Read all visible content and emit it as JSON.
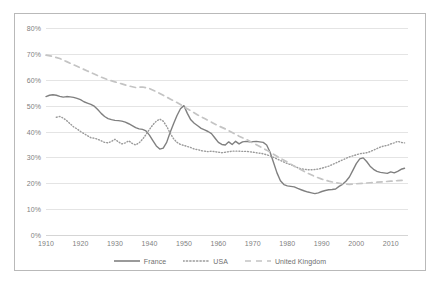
{
  "chart_data": {
    "type": "line",
    "title": "",
    "subtitle": "",
    "xlabel": "",
    "ylabel": "",
    "xlim": [
      1910,
      2015
    ],
    "ylim": [
      0,
      0.8
    ],
    "grid": true,
    "legend_position": "bottom",
    "y_ticks": [
      "0%",
      "10%",
      "20%",
      "30%",
      "40%",
      "50%",
      "60%",
      "70%",
      "80%"
    ],
    "y_tick_values": [
      0,
      10,
      20,
      30,
      40,
      50,
      60,
      70,
      80
    ],
    "x_ticks": [
      "1910",
      "1920",
      "1930",
      "1940",
      "1950",
      "1960",
      "1970",
      "1980",
      "1990",
      "2000",
      "2010"
    ],
    "x_tick_values": [
      1910,
      1920,
      1930,
      1940,
      1950,
      1960,
      1970,
      1980,
      1990,
      2000,
      2010
    ],
    "series": [
      {
        "name": "France",
        "style": "solid",
        "color": "#808080",
        "x": [
          1910,
          1911,
          1912,
          1913,
          1914,
          1915,
          1916,
          1917,
          1918,
          1919,
          1920,
          1921,
          1922,
          1923,
          1924,
          1925,
          1926,
          1927,
          1928,
          1929,
          1930,
          1931,
          1932,
          1933,
          1934,
          1935,
          1936,
          1937,
          1938,
          1939,
          1940,
          1941,
          1942,
          1943,
          1944,
          1945,
          1946,
          1947,
          1948,
          1949,
          1950,
          1951,
          1952,
          1953,
          1954,
          1955,
          1956,
          1957,
          1958,
          1959,
          1960,
          1961,
          1962,
          1963,
          1964,
          1965,
          1966,
          1967,
          1968,
          1969,
          1970,
          1971,
          1972,
          1973,
          1974,
          1975,
          1976,
          1977,
          1978,
          1979,
          1980,
          1981,
          1982,
          1983,
          1984,
          1985,
          1986,
          1987,
          1988,
          1989,
          1990,
          1991,
          1992,
          1993,
          1994,
          1995,
          1996,
          1997,
          1998,
          1999,
          2000,
          2001,
          2002,
          2003,
          2004,
          2005,
          2006,
          2007,
          2008,
          2009,
          2010,
          2011,
          2012,
          2013,
          2014
        ],
        "values": [
          53.5,
          54.0,
          54.2,
          54.0,
          53.6,
          53.3,
          53.5,
          53.4,
          53.2,
          52.8,
          52.3,
          51.5,
          51.0,
          50.5,
          49.8,
          48.5,
          47.0,
          45.8,
          45.0,
          44.6,
          44.3,
          44.2,
          44.0,
          43.6,
          43.0,
          42.3,
          41.5,
          41.0,
          40.8,
          40.2,
          38.6,
          36.5,
          34.4,
          33.2,
          33.6,
          35.8,
          39.6,
          43.0,
          46.2,
          48.8,
          50.0,
          47.0,
          44.5,
          43.2,
          42.2,
          41.2,
          40.6,
          40.0,
          39.2,
          37.5,
          35.8,
          35.0,
          34.8,
          36.0,
          35.0,
          36.2,
          35.2,
          36.0,
          36.2,
          36.0,
          36.1,
          36.2,
          36.0,
          35.8,
          34.8,
          32.0,
          28.0,
          24.0,
          21.0,
          19.5,
          19.0,
          18.8,
          18.6,
          18.0,
          17.5,
          17.0,
          16.6,
          16.3,
          16.0,
          16.3,
          16.8,
          17.2,
          17.5,
          17.6,
          17.8,
          18.8,
          19.6,
          20.8,
          22.4,
          25.0,
          27.6,
          29.4,
          29.8,
          28.4,
          26.6,
          25.4,
          24.6,
          24.2,
          24.0,
          23.8,
          24.4,
          24.0,
          24.6,
          25.4,
          25.8
        ]
      },
      {
        "name": "USA",
        "style": "dotted",
        "color": "#9a9a9a",
        "x": [
          1913,
          1914,
          1915,
          1916,
          1917,
          1918,
          1919,
          1920,
          1921,
          1922,
          1923,
          1924,
          1925,
          1926,
          1927,
          1928,
          1929,
          1930,
          1931,
          1932,
          1933,
          1934,
          1935,
          1936,
          1937,
          1938,
          1939,
          1940,
          1941,
          1942,
          1943,
          1944,
          1945,
          1946,
          1947,
          1948,
          1949,
          1950,
          1951,
          1952,
          1953,
          1954,
          1955,
          1956,
          1957,
          1958,
          1959,
          1960,
          1961,
          1962,
          1963,
          1964,
          1965,
          1966,
          1967,
          1968,
          1969,
          1970,
          1971,
          1972,
          1973,
          1974,
          1975,
          1976,
          1977,
          1978,
          1979,
          1980,
          1981,
          1982,
          1983,
          1984,
          1985,
          1986,
          1987,
          1988,
          1989,
          1990,
          1991,
          1992,
          1993,
          1994,
          1995,
          1996,
          1997,
          1998,
          1999,
          2000,
          2001,
          2002,
          2003,
          2004,
          2005,
          2006,
          2007,
          2008,
          2009,
          2010,
          2011,
          2012,
          2013,
          2014
        ],
        "values": [
          45.5,
          45.8,
          45.2,
          44.2,
          43.0,
          41.8,
          41.0,
          40.0,
          39.2,
          38.4,
          37.6,
          37.4,
          37.0,
          36.4,
          35.8,
          35.6,
          36.2,
          37.0,
          36.0,
          35.2,
          35.6,
          36.4,
          35.4,
          34.8,
          35.6,
          37.0,
          38.8,
          40.8,
          42.6,
          44.0,
          44.8,
          44.0,
          42.0,
          39.4,
          37.2,
          35.8,
          35.0,
          34.6,
          34.2,
          33.8,
          33.2,
          33.0,
          32.6,
          32.4,
          32.2,
          32.4,
          32.2,
          32.0,
          31.8,
          32.0,
          32.2,
          32.4,
          32.4,
          32.4,
          32.3,
          32.3,
          32.2,
          32.0,
          31.8,
          31.6,
          31.4,
          31.0,
          30.6,
          30.0,
          29.4,
          28.8,
          28.2,
          27.6,
          27.2,
          26.6,
          26.0,
          25.6,
          25.4,
          25.2,
          25.2,
          25.3,
          25.5,
          25.8,
          26.2,
          26.6,
          27.2,
          27.8,
          28.4,
          29.0,
          29.6,
          30.2,
          30.6,
          31.0,
          31.4,
          31.6,
          31.8,
          32.2,
          32.8,
          33.4,
          34.0,
          34.4,
          34.6,
          35.2,
          35.6,
          36.2,
          35.8,
          35.6
        ]
      },
      {
        "name": "United Kingdom",
        "style": "dashed",
        "color": "#c4c4c4",
        "x": [
          1910,
          1912,
          1914,
          1916,
          1918,
          1920,
          1922,
          1924,
          1926,
          1928,
          1930,
          1932,
          1934,
          1936,
          1938,
          1940,
          1942,
          1944,
          1946,
          1948,
          1950,
          1952,
          1954,
          1956,
          1958,
          1960,
          1962,
          1964,
          1966,
          1968,
          1970,
          1972,
          1974,
          1976,
          1978,
          1980,
          1982,
          1984,
          1986,
          1988,
          1990,
          1992,
          1994,
          1996,
          1998,
          2000,
          2002,
          2004,
          2006,
          2008,
          2010,
          2012,
          2014
        ],
        "values": [
          69.5,
          69.0,
          68.2,
          67.0,
          65.8,
          64.6,
          63.4,
          62.2,
          61.0,
          60.0,
          59.2,
          58.4,
          57.6,
          57.0,
          57.2,
          56.6,
          55.4,
          54.0,
          52.6,
          51.2,
          49.6,
          48.0,
          46.4,
          45.0,
          43.6,
          42.2,
          41.0,
          39.6,
          38.2,
          37.0,
          35.6,
          34.2,
          32.8,
          31.2,
          29.6,
          28.2,
          26.6,
          25.2,
          23.8,
          22.6,
          21.6,
          20.8,
          20.2,
          19.8,
          19.6,
          19.8,
          20.0,
          20.2,
          20.4,
          20.6,
          20.8,
          21.0,
          21.2
        ]
      }
    ]
  },
  "legend": {
    "items": [
      {
        "label": "France"
      },
      {
        "label": "USA"
      },
      {
        "label": "United Kingdom"
      }
    ]
  }
}
